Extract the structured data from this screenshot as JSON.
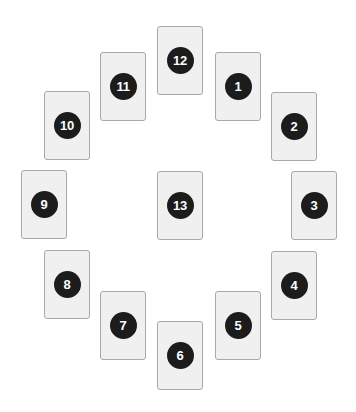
{
  "spread": {
    "colors": {
      "background": "#ffffff",
      "card_fill": "#f0f0f0",
      "card_border": "#a8a8a8",
      "badge_fill": "#1c1c1c",
      "badge_text": "#ffffff"
    },
    "cards": [
      {
        "label": "1",
        "x": 215,
        "y": 52
      },
      {
        "label": "2",
        "x": 271,
        "y": 92
      },
      {
        "label": "3",
        "x": 291,
        "y": 171
      },
      {
        "label": "4",
        "x": 271,
        "y": 251
      },
      {
        "label": "5",
        "x": 215,
        "y": 291
      },
      {
        "label": "6",
        "x": 157,
        "y": 321
      },
      {
        "label": "7",
        "x": 100,
        "y": 291
      },
      {
        "label": "8",
        "x": 44,
        "y": 250
      },
      {
        "label": "9",
        "x": 21,
        "y": 170
      },
      {
        "label": "10",
        "x": 44,
        "y": 91
      },
      {
        "label": "11",
        "x": 100,
        "y": 52
      },
      {
        "label": "12",
        "x": 157,
        "y": 26
      },
      {
        "label": "13",
        "x": 157,
        "y": 171
      }
    ]
  }
}
